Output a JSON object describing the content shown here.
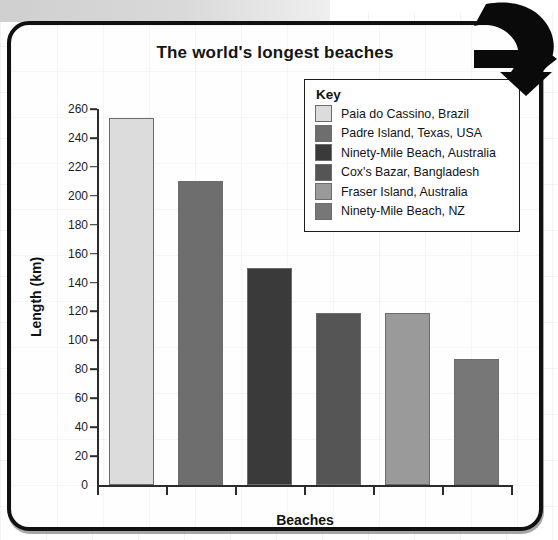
{
  "chart_data": {
    "type": "bar",
    "title": "The world's longest beaches",
    "xlabel": "Beaches",
    "ylabel": "Length (km)",
    "ylim": [
      0,
      260
    ],
    "ytick_step": 20,
    "yticks": [
      "0",
      "20",
      "40",
      "60",
      "80",
      "100",
      "120",
      "140",
      "160",
      "180",
      "200",
      "220",
      "240",
      "260"
    ],
    "grid": false,
    "legend_position": "upper-right",
    "categories": [
      "Paia do Cassino, Brazil",
      "Padre Island, Texas, USA",
      "Ninety-Mile Beach, Australia",
      "Cox's Bazar, Bangladesh",
      "Fraser Island, Australia",
      "Ninety-Mile Beach, NZ"
    ],
    "values": [
      254,
      210,
      150,
      119,
      119,
      87
    ],
    "colors": [
      "#dcdcdc",
      "#6e6e6e",
      "#3a3a3a",
      "#555555",
      "#9a9a9a",
      "#777777"
    ]
  },
  "legend": {
    "title": "Key",
    "items": [
      {
        "label": "Paia do Cassino, Brazil",
        "color": "#dcdcdc"
      },
      {
        "label": "Padre Island, Texas, USA",
        "color": "#6e6e6e"
      },
      {
        "label": "Ninety-Mile Beach, Australia",
        "color": "#3a3a3a"
      },
      {
        "label": "Cox's Bazar, Bangladesh",
        "color": "#555555"
      },
      {
        "label": "Fraser Island, Australia",
        "color": "#9a9a9a"
      },
      {
        "label": "Ninety-Mile Beach, NZ",
        "color": "#777777"
      }
    ]
  },
  "decoration": {
    "arrow_icon": "curved-arrow-right-icon",
    "cutoff_text": ""
  }
}
